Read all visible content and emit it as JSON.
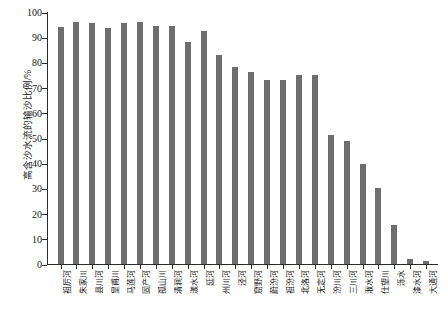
{
  "chart_data": {
    "type": "bar",
    "title": "",
    "xlabel": "",
    "ylabel": "高含沙水流的输沙比例/%",
    "ylim": [
      0,
      100
    ],
    "ytick_labels": [
      "100",
      "90",
      "80",
      "70",
      "60",
      "50",
      "40",
      "30",
      "20",
      "10",
      "0"
    ],
    "ytick_values": [
      100,
      90,
      80,
      70,
      60,
      50,
      40,
      30,
      20,
      10,
      0
    ],
    "grid": false,
    "legend": "none",
    "bar_color": "#6e6e6e",
    "axis_color": "#2b2b2b",
    "categories": [
      "祖厉河",
      "朱家川",
      "县川河",
      "皇甫川",
      "马莲河",
      "固产河",
      "孤山川",
      "清涧河",
      "漾水河",
      "延河",
      "州川河",
      "泾河",
      "窟野河",
      "蔚汾河",
      "祖汾河",
      "北洛河",
      "无定河",
      "汾川河",
      "三川河",
      "湫水河",
      "仕望川",
      "泺水",
      "漆水河",
      "大通河"
    ],
    "values": [
      94.0,
      96.0,
      95.5,
      93.5,
      95.5,
      96.0,
      94.5,
      94.5,
      88.0,
      92.5,
      83.0,
      78.0,
      76.0,
      73.0,
      73.0,
      75.0,
      75.0,
      51.0,
      49.0,
      39.5,
      30.0,
      15.5,
      2.0,
      1.0
    ]
  }
}
